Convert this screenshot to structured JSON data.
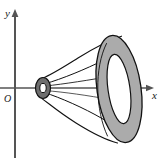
{
  "figure": {
    "kind": "math-diagram",
    "background_color": "#ffffff"
  },
  "axes": {
    "x_axis": {
      "label": "x",
      "label_x": 153,
      "label_y": 98,
      "y_position": 88,
      "start_x": 0,
      "end_x": 152,
      "arrow": "right",
      "color": "#555555"
    },
    "y_axis": {
      "label": "y",
      "label_x": 6,
      "label_y": 17,
      "x_position": 15,
      "start_y": 158,
      "end_y": 12,
      "arrow": "up",
      "color": "#555555"
    },
    "origin": {
      "label": "O",
      "label_x": 5,
      "label_y": 102
    }
  },
  "shapes": {
    "small_annulus": {
      "name": "small-annulus",
      "center_x": 43,
      "center_y": 88,
      "outer_rx": 7.5,
      "outer_ry": 10.5,
      "inner_rx": 3.2,
      "inner_ry": 4.6,
      "fill": "#6e6e6e",
      "hole_fill": "#ffffff",
      "stroke": "#111111"
    },
    "large_annulus": {
      "name": "large-annulus",
      "center_x": 119,
      "center_y": 89,
      "outer_rx": 22,
      "outer_ry": 54,
      "inner_rx": 11,
      "inner_ry": 35,
      "rotation_deg": -8,
      "fill": "#ababab",
      "hole_fill": "#ffffff",
      "stroke": "#111111"
    },
    "surface": {
      "name": "revolution-surface",
      "stroke": "#111111",
      "stroke_width": 1.1,
      "fill": "#ffffff"
    }
  },
  "colors": {
    "outline": "#111111",
    "shade_gray": "#ababab",
    "dark_gray": "#6e6e6e",
    "axis_gray": "#555555",
    "white": "#ffffff"
  }
}
